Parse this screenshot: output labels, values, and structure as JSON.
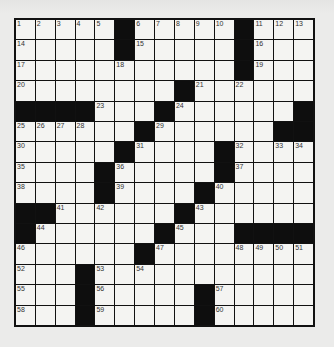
{
  "puzzle": {
    "size": {
      "rows": 15,
      "cols": 15
    },
    "colors": {
      "black": "#0e0e0e",
      "white": "#f4f4f2",
      "border": "#111111",
      "background": "#ebebea"
    },
    "grid": [
      ".....#.....#...",
      ".....#.....#...",
      "...........#...",
      "........#......",
      "####...#......#",
      "......#......##",
      ".....#....#....",
      "....#.....#....",
      "....#....#.....",
      "##......#......",
      "#......#...####",
      "......#........",
      "...#...........",
      "...#.....#.....",
      "...#.....#....."
    ],
    "numbers": [
      {
        "r": 0,
        "c": 0,
        "n": "1"
      },
      {
        "r": 0,
        "c": 1,
        "n": "2"
      },
      {
        "r": 0,
        "c": 2,
        "n": "3"
      },
      {
        "r": 0,
        "c": 3,
        "n": "4"
      },
      {
        "r": 0,
        "c": 4,
        "n": "5"
      },
      {
        "r": 0,
        "c": 6,
        "n": "6"
      },
      {
        "r": 0,
        "c": 7,
        "n": "7"
      },
      {
        "r": 0,
        "c": 8,
        "n": "8"
      },
      {
        "r": 0,
        "c": 9,
        "n": "9"
      },
      {
        "r": 0,
        "c": 10,
        "n": "10"
      },
      {
        "r": 0,
        "c": 12,
        "n": "11"
      },
      {
        "r": 0,
        "c": 13,
        "n": "12"
      },
      {
        "r": 0,
        "c": 14,
        "n": "13"
      },
      {
        "r": 1,
        "c": 0,
        "n": "14"
      },
      {
        "r": 1,
        "c": 6,
        "n": "15"
      },
      {
        "r": 1,
        "c": 12,
        "n": "16"
      },
      {
        "r": 2,
        "c": 0,
        "n": "17"
      },
      {
        "r": 2,
        "c": 5,
        "n": "18"
      },
      {
        "r": 2,
        "c": 12,
        "n": "19"
      },
      {
        "r": 3,
        "c": 0,
        "n": "20"
      },
      {
        "r": 3,
        "c": 9,
        "n": "21"
      },
      {
        "r": 3,
        "c": 11,
        "n": "22"
      },
      {
        "r": 4,
        "c": 4,
        "n": "23"
      },
      {
        "r": 4,
        "c": 8,
        "n": "24"
      },
      {
        "r": 5,
        "c": 0,
        "n": "25"
      },
      {
        "r": 5,
        "c": 1,
        "n": "26"
      },
      {
        "r": 5,
        "c": 2,
        "n": "27"
      },
      {
        "r": 5,
        "c": 3,
        "n": "28"
      },
      {
        "r": 5,
        "c": 7,
        "n": "29"
      },
      {
        "r": 6,
        "c": 0,
        "n": "30"
      },
      {
        "r": 6,
        "c": 6,
        "n": "31"
      },
      {
        "r": 6,
        "c": 11,
        "n": "32"
      },
      {
        "r": 6,
        "c": 13,
        "n": "33"
      },
      {
        "r": 6,
        "c": 14,
        "n": "34"
      },
      {
        "r": 7,
        "c": 0,
        "n": "35"
      },
      {
        "r": 7,
        "c": 5,
        "n": "36"
      },
      {
        "r": 7,
        "c": 11,
        "n": "37"
      },
      {
        "r": 8,
        "c": 0,
        "n": "38"
      },
      {
        "r": 8,
        "c": 5,
        "n": "39"
      },
      {
        "r": 8,
        "c": 10,
        "n": "40"
      },
      {
        "r": 9,
        "c": 2,
        "n": "41"
      },
      {
        "r": 9,
        "c": 4,
        "n": "42"
      },
      {
        "r": 9,
        "c": 9,
        "n": "43"
      },
      {
        "r": 10,
        "c": 1,
        "n": "44"
      },
      {
        "r": 10,
        "c": 8,
        "n": "45"
      },
      {
        "r": 11,
        "c": 0,
        "n": "46"
      },
      {
        "r": 11,
        "c": 7,
        "n": "47"
      },
      {
        "r": 11,
        "c": 11,
        "n": "48"
      },
      {
        "r": 11,
        "c": 12,
        "n": "49"
      },
      {
        "r": 11,
        "c": 13,
        "n": "50"
      },
      {
        "r": 11,
        "c": 14,
        "n": "51"
      },
      {
        "r": 12,
        "c": 0,
        "n": "52"
      },
      {
        "r": 12,
        "c": 4,
        "n": "53"
      },
      {
        "r": 12,
        "c": 6,
        "n": "54"
      },
      {
        "r": 13,
        "c": 0,
        "n": "55"
      },
      {
        "r": 13,
        "c": 4,
        "n": "56"
      },
      {
        "r": 13,
        "c": 10,
        "n": "57"
      },
      {
        "r": 14,
        "c": 0,
        "n": "58"
      },
      {
        "r": 14,
        "c": 4,
        "n": "59"
      },
      {
        "r": 14,
        "c": 10,
        "n": "60"
      }
    ]
  }
}
